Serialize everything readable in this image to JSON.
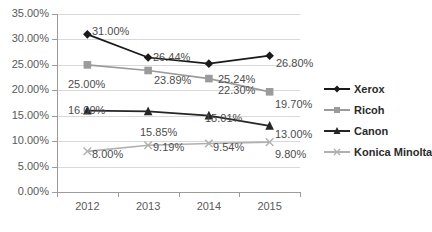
{
  "chart_data": {
    "type": "line",
    "title": "",
    "xlabel": "",
    "ylabel": "",
    "categories": [
      "2012",
      "2013",
      "2014",
      "2015"
    ],
    "ylim": [
      0,
      35
    ],
    "ytick_labels": [
      "0.00%",
      "5.00%",
      "10.00%",
      "15.00%",
      "20.00%",
      "25.00%",
      "30.00%",
      "35.00%"
    ],
    "ytick_values": [
      0,
      5,
      10,
      15,
      20,
      25,
      30,
      35
    ],
    "grid": true,
    "legend_position": "right",
    "series": [
      {
        "name": "Xerox",
        "color": "#1a1a1a",
        "marker": "diamond",
        "values": [
          31.0,
          26.44,
          25.24,
          26.8
        ],
        "labels": [
          "31.00%",
          "26.44%",
          "25.24%",
          "26.80%"
        ]
      },
      {
        "name": "Ricoh",
        "color": "#9b9b9b",
        "marker": "square",
        "values": [
          25.0,
          23.89,
          22.3,
          19.7
        ],
        "labels": [
          "25.00%",
          "23.89%",
          "22.30%",
          "19.70%"
        ]
      },
      {
        "name": "Canon",
        "color": "#262626",
        "marker": "triangle",
        "values": [
          16.0,
          15.85,
          15.01,
          13.0
        ],
        "labels": [
          "16.00%",
          "15.85%",
          "15.01%",
          "13.00%"
        ]
      },
      {
        "name": "Konica Minolta",
        "color": "#b0b0b0",
        "marker": "x",
        "values": [
          8.0,
          9.19,
          9.54,
          9.8
        ],
        "labels": [
          "8.00%",
          "9.19%",
          "9.54%",
          "9.80%"
        ]
      }
    ],
    "data_labels": [
      {
        "text": "31.00%",
        "x": 92,
        "y": 25
      },
      {
        "text": "26.44%",
        "x": 153,
        "y": 51
      },
      {
        "text": "25.24%",
        "x": 218,
        "y": 73
      },
      {
        "text": "26.80%",
        "x": 276,
        "y": 57
      },
      {
        "text": "25.00%",
        "x": 68,
        "y": 78
      },
      {
        "text": "23.89%",
        "x": 154,
        "y": 74
      },
      {
        "text": "22.30%",
        "x": 218,
        "y": 84
      },
      {
        "text": "19.70%",
        "x": 275,
        "y": 98
      },
      {
        "text": "16.00%",
        "x": 68,
        "y": 104
      },
      {
        "text": "15.85%",
        "x": 140,
        "y": 126
      },
      {
        "text": "15.01%",
        "x": 205,
        "y": 112
      },
      {
        "text": "13.00%",
        "x": 275,
        "y": 128
      },
      {
        "text": "8.00%",
        "x": 92,
        "y": 148
      },
      {
        "text": "9.19%",
        "x": 153,
        "y": 141
      },
      {
        "text": "9.54%",
        "x": 213,
        "y": 141
      },
      {
        "text": "9.80%",
        "x": 275,
        "y": 148
      }
    ]
  },
  "axis": {
    "y_labels": [
      "35.00%",
      "30.00%",
      "25.00%",
      "20.00%",
      "15.00%",
      "10.00%",
      "5.00%",
      "0.00%"
    ],
    "x_labels": [
      "2012",
      "2013",
      "2014",
      "2015"
    ]
  },
  "legend": {
    "items": [
      {
        "label": "Xerox",
        "color": "#1a1a1a",
        "marker": "diamond"
      },
      {
        "label": "Ricoh",
        "color": "#9b9b9b",
        "marker": "square"
      },
      {
        "label": "Canon",
        "color": "#262626",
        "marker": "triangle"
      },
      {
        "label": "Konica Minolta",
        "color": "#b0b0b0",
        "marker": "x"
      }
    ]
  }
}
